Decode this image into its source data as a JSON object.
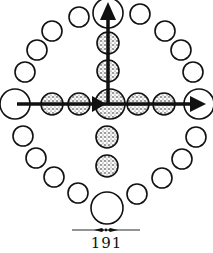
{
  "page": {
    "number": "191"
  },
  "colors": {
    "ink": "#111111",
    "paper": "#ffffff",
    "stipple": "#6a6a6a"
  },
  "diagram": {
    "ring_large": [
      {
        "name": "top",
        "cx": 108,
        "cy": 13,
        "r": 15
      },
      {
        "name": "left",
        "cx": 15,
        "cy": 104,
        "r": 15
      },
      {
        "name": "right",
        "cx": 199,
        "cy": 104,
        "r": 15
      },
      {
        "name": "bottom",
        "cx": 107,
        "cy": 208,
        "r": 16
      }
    ],
    "ring_small": [
      {
        "cx": 79,
        "cy": 17
      },
      {
        "cx": 52,
        "cy": 31
      },
      {
        "cx": 37,
        "cy": 50
      },
      {
        "cx": 25,
        "cy": 72
      },
      {
        "cx": 23,
        "cy": 136
      },
      {
        "cx": 36,
        "cy": 158
      },
      {
        "cx": 54,
        "cy": 177
      },
      {
        "cx": 78,
        "cy": 193
      },
      {
        "cx": 140,
        "cy": 14
      },
      {
        "cx": 165,
        "cy": 31
      },
      {
        "cx": 181,
        "cy": 50
      },
      {
        "cx": 193,
        "cy": 72
      },
      {
        "cx": 196,
        "cy": 137
      },
      {
        "cx": 182,
        "cy": 159
      },
      {
        "cx": 162,
        "cy": 178
      },
      {
        "cx": 137,
        "cy": 194
      }
    ],
    "stippled": [
      {
        "cx": 108,
        "cy": 43,
        "r": 11
      },
      {
        "cx": 108,
        "cy": 71,
        "r": 11
      },
      {
        "cx": 107,
        "cy": 137,
        "r": 11
      },
      {
        "cx": 107,
        "cy": 166,
        "r": 11
      },
      {
        "cx": 52,
        "cy": 104,
        "r": 11
      },
      {
        "cx": 79,
        "cy": 104,
        "r": 11
      },
      {
        "cx": 138,
        "cy": 104,
        "r": 11
      },
      {
        "cx": 164,
        "cy": 104,
        "r": 11
      },
      {
        "cx": 110,
        "cy": 104,
        "r": 15
      }
    ],
    "arrows": [
      {
        "name": "horizontal-arrow",
        "direction": "right"
      },
      {
        "name": "vertical-arrow",
        "direction": "up"
      },
      {
        "name": "inner-arrowhead",
        "direction": "right"
      }
    ]
  }
}
